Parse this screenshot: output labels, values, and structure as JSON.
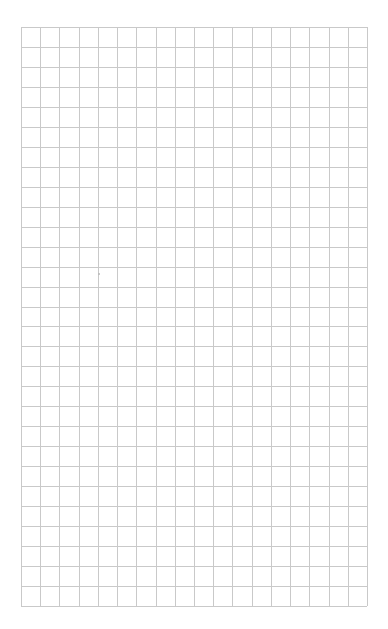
{
  "page": {
    "type": "grid-paper",
    "background_color": "#ffffff",
    "line_color": "#c9c9c9"
  },
  "grid": {
    "columns": 18,
    "rows": 29,
    "left": 21,
    "top": 27,
    "width": 346,
    "height": 579
  }
}
